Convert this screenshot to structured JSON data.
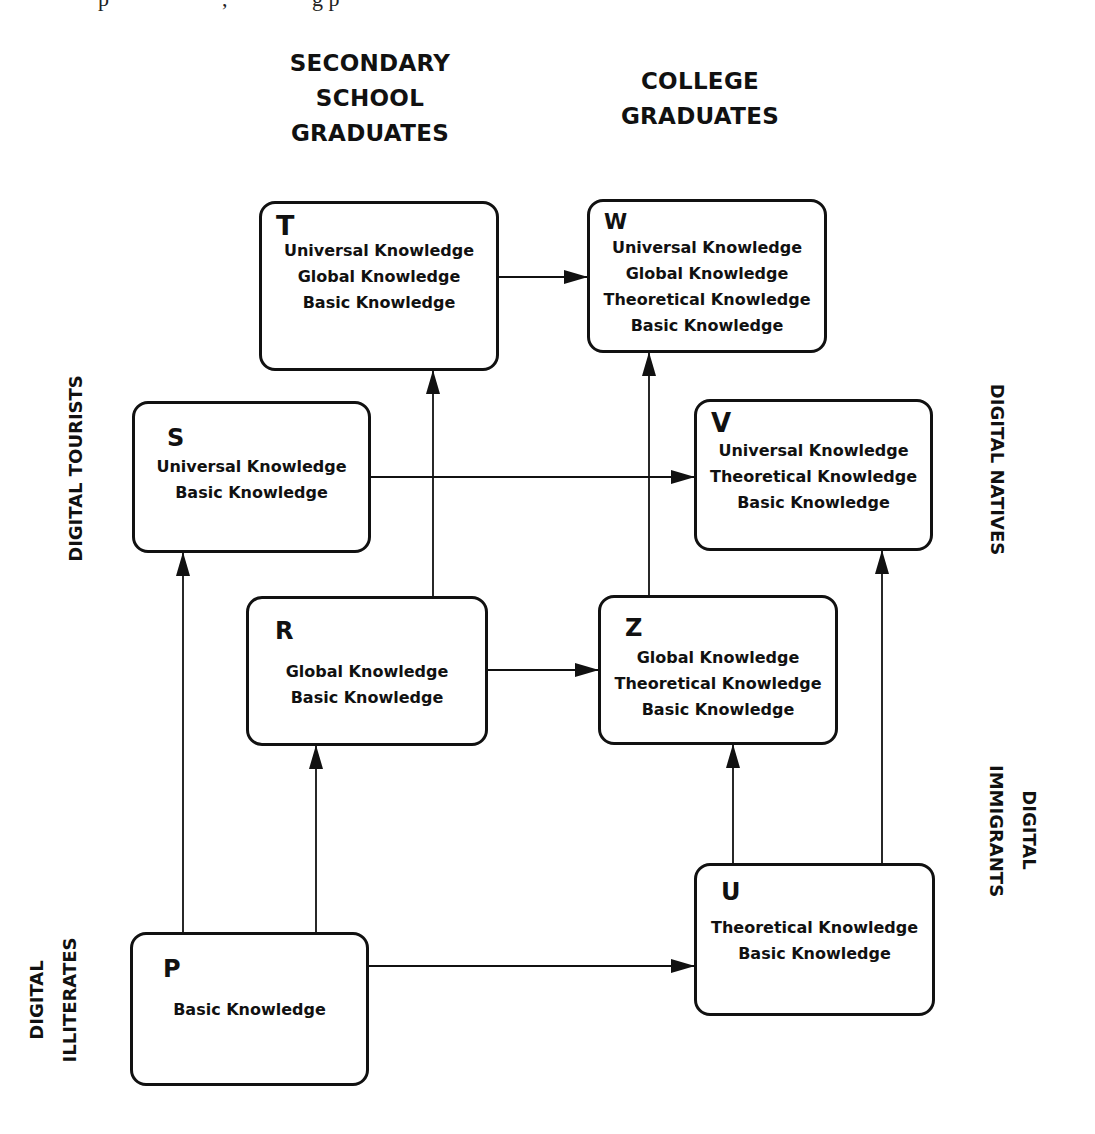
{
  "header_fragment": {
    "text_left": "p",
    "text_mid": ",",
    "text_right": "g p"
  },
  "columns": {
    "secondary": {
      "lines": [
        "SECONDARY",
        "SCHOOL",
        "GRADUATES"
      ]
    },
    "college": {
      "lines": [
        "COLLEGE",
        "GRADUATES"
      ]
    }
  },
  "side_labels": {
    "digital_tourists": {
      "lines": [
        "DIGITAL TOURISTS"
      ]
    },
    "digital_natives": {
      "lines": [
        "DIGITAL NATIVES"
      ]
    },
    "digital_immigrants": {
      "lines": [
        "DIGITAL",
        "IMMIGRANTS"
      ]
    },
    "digital_illiterates": {
      "lines": [
        "DIGITAL",
        "ILLITERATES"
      ]
    }
  },
  "nodes": {
    "T": {
      "letter": "T",
      "lines": [
        "Universal Knowledge",
        "Global Knowledge",
        "Basic Knowledge"
      ]
    },
    "W": {
      "letter": "W",
      "lines": [
        "Universal Knowledge",
        "Global Knowledge",
        "Theoretical Knowledge",
        "Basic Knowledge"
      ]
    },
    "S": {
      "letter": "S",
      "lines": [
        "Universal Knowledge",
        "Basic Knowledge"
      ]
    },
    "V": {
      "letter": "V",
      "lines": [
        "Universal Knowledge",
        "Theoretical Knowledge",
        "Basic Knowledge"
      ]
    },
    "R": {
      "letter": "R",
      "lines": [
        "Global Knowledge",
        "Basic Knowledge"
      ]
    },
    "Z": {
      "letter": "Z",
      "lines": [
        "Global Knowledge",
        "Theoretical Knowledge",
        "Basic Knowledge"
      ]
    },
    "P": {
      "letter": "P",
      "lines": [
        "Basic Knowledge"
      ]
    },
    "U": {
      "letter": "U",
      "lines": [
        "Theoretical Knowledge",
        "Basic Knowledge"
      ]
    }
  },
  "edges": [
    {
      "from": "T",
      "to": "W"
    },
    {
      "from": "S",
      "to": "V"
    },
    {
      "from": "R",
      "to": "T"
    },
    {
      "from": "R",
      "to": "Z"
    },
    {
      "from": "Z",
      "to": "W"
    },
    {
      "from": "P",
      "to": "S"
    },
    {
      "from": "P",
      "to": "R"
    },
    {
      "from": "P",
      "to": "U"
    },
    {
      "from": "U",
      "to": "Z"
    },
    {
      "from": "U",
      "to": "V"
    }
  ],
  "colors": {
    "stroke": "#111111",
    "background": "#ffffff"
  }
}
